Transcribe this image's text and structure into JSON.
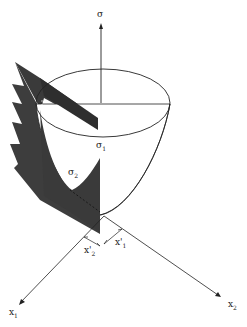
{
  "diagram": {
    "labels": {
      "sigma_axis": "σ",
      "sigma1": "σ",
      "sigma1_sub": "1",
      "sigma2": "σ",
      "sigma2_sub": "2",
      "x1_axis": "x",
      "x1_axis_sub": "1",
      "x2_axis": "x",
      "x2_axis_sub": "2",
      "x1_prime": "x'",
      "x1_prime_sub": "1",
      "x2_prime": "x'",
      "x2_prime_sub": "2"
    },
    "colors": {
      "line": "#222222",
      "plane": "#3a3a3a",
      "background": "#ffffff"
    }
  }
}
